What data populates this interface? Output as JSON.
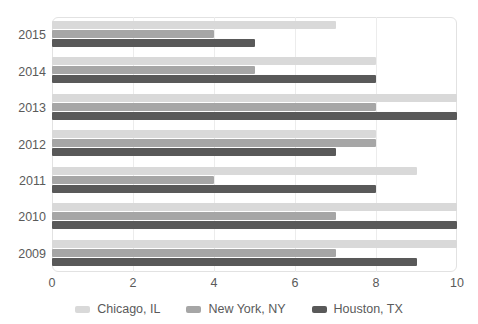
{
  "chart_data": {
    "type": "bar",
    "orientation": "horizontal",
    "title": "",
    "xlabel": "",
    "ylabel": "",
    "categories": [
      "2015",
      "2014",
      "2013",
      "2012",
      "2011",
      "2010",
      "2009"
    ],
    "series": [
      {
        "name": "Chicago, IL",
        "color": "#d9d9d9",
        "values": [
          7,
          8,
          10,
          8,
          9,
          10,
          10
        ]
      },
      {
        "name": "New York, NY",
        "color": "#a6a6a6",
        "values": [
          4,
          5,
          8,
          8,
          4,
          7,
          7
        ]
      },
      {
        "name": "Houston, TX",
        "color": "#595959",
        "values": [
          5,
          8,
          10,
          7,
          8,
          10,
          9
        ]
      }
    ],
    "xticks": [
      "0",
      "2",
      "4",
      "6",
      "8",
      "10"
    ],
    "xlim": [
      0,
      10
    ],
    "grid": true,
    "legend_position": "bottom"
  },
  "legend": {
    "items": [
      {
        "label": "Chicago, IL",
        "color": "#d9d9d9"
      },
      {
        "label": "New York, NY",
        "color": "#a6a6a6"
      },
      {
        "label": "Houston, TX",
        "color": "#595959"
      }
    ]
  }
}
